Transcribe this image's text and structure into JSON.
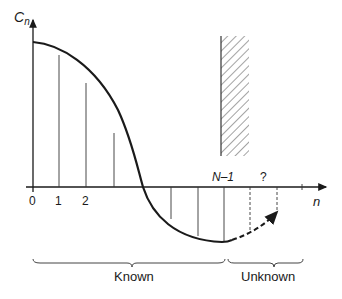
{
  "diagram": {
    "y_axis_label": "C",
    "y_axis_subscript": "n",
    "x_axis_label": "n",
    "tick_labels": [
      "0",
      "1",
      "2"
    ],
    "last_known_label": "N–1",
    "unknown_marker": "?",
    "brace_known_label": "Known",
    "brace_unknown_label": "Unknown",
    "colors": {
      "stroke": "#1a1a1a",
      "thin": "#333333",
      "hatch": "#555555"
    }
  }
}
